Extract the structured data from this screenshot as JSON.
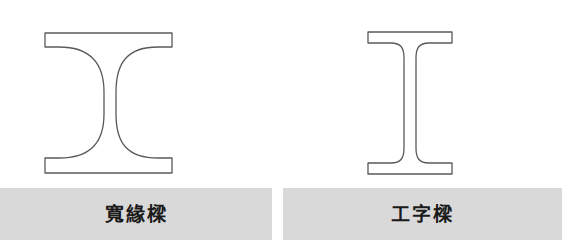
{
  "figure": {
    "width": 562,
    "height": 249,
    "background_color": "#ffffff",
    "outline_color": "#595959",
    "caption_band_color": "#d9d9d9",
    "caption_text_color": "#1a1a1a"
  },
  "panels": [
    {
      "id": "wide-flange",
      "caption": "寬緣樑",
      "shape_type": "wide-flange-beam-cross-section",
      "geometry": {
        "flange_left_x": 45,
        "flange_right_x": 172,
        "flange_width": 127,
        "top_flange_top_y": 33,
        "top_flange_bottom_y": 47,
        "bottom_flange_top_y": 158,
        "bottom_flange_bottom_y": 173,
        "flange_thickness": 14,
        "web_left_x": 104,
        "web_right_x": 116,
        "web_thickness": 12,
        "fillet_radius": 42,
        "overall_height": 140
      }
    },
    {
      "id": "i-beam",
      "caption": "工字樑",
      "shape_type": "i-beam-cross-section",
      "geometry": {
        "flange_left_x": 368,
        "flange_right_x": 452,
        "flange_width": 84,
        "top_flange_top_y": 32,
        "top_flange_bottom_y": 43,
        "bottom_flange_top_y": 163,
        "bottom_flange_bottom_y": 174,
        "flange_thickness": 11,
        "web_left_x": 404,
        "web_right_x": 416,
        "web_thickness": 12,
        "fillet_radius": 13,
        "overall_height": 142
      }
    }
  ],
  "caption_band": {
    "top_y": 188,
    "height": 52,
    "left_cell_width": 272,
    "gap_width": 11,
    "right_cell_width": 279
  }
}
